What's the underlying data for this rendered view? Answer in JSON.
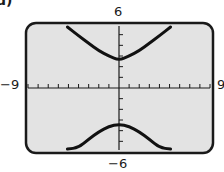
{
  "panel_label": "d)",
  "window": {
    "xmin_label": "−9",
    "xmax_label": "9",
    "ymin_label": "−6",
    "ymax_label": "6"
  },
  "colors": {
    "screen_bg": "#e3e3e3",
    "frame": "#1a1a1a",
    "curve": "#111111"
  },
  "chart_data": {
    "type": "line",
    "title": "",
    "xlabel": "",
    "ylabel": "",
    "xlim": [
      -9,
      9
    ],
    "ylim": [
      -6,
      6
    ],
    "xticks_step": 1,
    "yticks_step": 1,
    "grid": false,
    "series": [
      {
        "name": "upper branch",
        "x": [
          -5.1,
          -4,
          -3,
          -2,
          -1,
          0,
          1,
          2,
          3,
          4,
          5.1
        ],
        "y": [
          5.8,
          4.9,
          4.2,
          3.5,
          3.0,
          2.6,
          3.0,
          3.5,
          4.2,
          4.9,
          5.8
        ]
      },
      {
        "name": "lower branch",
        "x": [
          -5.1,
          -4,
          -3,
          -2,
          -1,
          0,
          1,
          2,
          3,
          4,
          5.1
        ],
        "y": [
          -6.5,
          -5.6,
          -4.8,
          -4.1,
          -3.6,
          -3.4,
          -3.6,
          -4.1,
          -4.8,
          -5.6,
          -6.5
        ]
      }
    ]
  }
}
